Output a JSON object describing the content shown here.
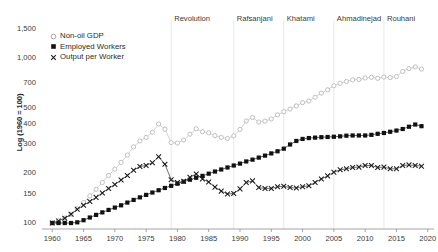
{
  "chart_data": {
    "type": "line",
    "title": "",
    "xlabel": "",
    "ylabel": "Log (1960 = 100)",
    "yscale": "log",
    "ylim": [
      92,
      1650
    ],
    "xlim": [
      1959,
      2021
    ],
    "grid": false,
    "legend_position": "top-left",
    "yticks": [
      100,
      150,
      200,
      300,
      400,
      500,
      700,
      1000,
      1500
    ],
    "ytick_labels": [
      "100",
      "150",
      "200",
      "300",
      "400",
      "500",
      "700",
      "1,000",
      "1,500"
    ],
    "xticks": [
      1960,
      1965,
      1970,
      1975,
      1980,
      1985,
      1990,
      1995,
      2000,
      2005,
      2010,
      2015,
      2020
    ],
    "xtick_labels": [
      "1960",
      "1965",
      "1970",
      "1975",
      "1980",
      "1985",
      "1990",
      "1995",
      "2000",
      "2005",
      "2010",
      "2015",
      "2020"
    ],
    "annotations": [
      {
        "label": "Revolution",
        "x": 1979
      },
      {
        "label": "Rafsanjani",
        "x": 1989
      },
      {
        "label": "Khatami",
        "x": 1997
      },
      {
        "label": "Ahmadinejad",
        "x": 2005
      },
      {
        "label": "Rouhani",
        "x": 2013
      }
    ],
    "x": [
      1960,
      1961,
      1962,
      1963,
      1964,
      1965,
      1966,
      1967,
      1968,
      1969,
      1970,
      1971,
      1972,
      1973,
      1974,
      1975,
      1976,
      1977,
      1978,
      1979,
      1980,
      1981,
      1982,
      1983,
      1984,
      1985,
      1986,
      1987,
      1988,
      1989,
      1990,
      1991,
      1992,
      1993,
      1994,
      1995,
      1996,
      1997,
      1998,
      1999,
      2000,
      2001,
      2002,
      2003,
      2004,
      2005,
      2006,
      2007,
      2008,
      2009,
      2010,
      2011,
      2012,
      2013,
      2014,
      2015,
      2016,
      2017,
      2018,
      2019
    ],
    "series": [
      {
        "name": "Non-oil GDP",
        "marker": "open-circle",
        "color": "#b9b9b9",
        "values": [
          100,
          103,
          107,
          113,
          122,
          133,
          146,
          160,
          176,
          194,
          212,
          233,
          258,
          289,
          314,
          330,
          355,
          398,
          370,
          307,
          305,
          318,
          345,
          372,
          357,
          352,
          338,
          330,
          325,
          337,
          369,
          415,
          436,
          409,
          414,
          427,
          452,
          472,
          490,
          512,
          536,
          548,
          578,
          612,
          641,
          678,
          702,
          720,
          736,
          740,
          756,
          763,
          752,
          765,
          760,
          772,
          828,
          861,
          882,
          855
        ],
        "values_note": "index, 1960 = 100"
      },
      {
        "name": "Employed Workers",
        "marker": "filled-square",
        "color": "#111111",
        "values": [
          100,
          100,
          100,
          100,
          101,
          104,
          108,
          112,
          116,
          120,
          124,
          128,
          133,
          138,
          143,
          148,
          153,
          158,
          163,
          168,
          173,
          178,
          183,
          188,
          193,
          199,
          205,
          211,
          217,
          223,
          229,
          236,
          242,
          249,
          256,
          264,
          272,
          282,
          299,
          314,
          323,
          327,
          329,
          331,
          332,
          333,
          335,
          338,
          339,
          339,
          339,
          342,
          347,
          351,
          357,
          363,
          371,
          383,
          395,
          386
        ],
        "values_note": "index, 1960 = 100"
      },
      {
        "name": "Output per Worker",
        "marker": "cross",
        "color": "#1a1a1a",
        "values": [
          100,
          103,
          107,
          113,
          121,
          128,
          135,
          143,
          152,
          162,
          171,
          182,
          194,
          209,
          220,
          223,
          232,
          252,
          227,
          183,
          176,
          179,
          189,
          198,
          185,
          177,
          165,
          156,
          150,
          151,
          161,
          176,
          180,
          164,
          162,
          162,
          166,
          167,
          164,
          163,
          166,
          168,
          176,
          185,
          193,
          203,
          210,
          213,
          217,
          218,
          223,
          223,
          217,
          218,
          213,
          213,
          223,
          225,
          223,
          221
        ],
        "values_note": "index, 1960 = 100"
      }
    ]
  },
  "legend": {
    "items": [
      {
        "label": "Non-oil GDP",
        "marker": "open-circle"
      },
      {
        "label": "Employed Workers",
        "marker": "filled-square"
      },
      {
        "label": "Output per Worker",
        "marker": "cross"
      }
    ]
  },
  "colors": {
    "background": "#ffffff",
    "axis": "#9a9a9a",
    "text": "#3a3a3a",
    "divider": "#e8e8e8",
    "gdp": "#b9b9b9",
    "workers": "#111111",
    "output": "#1a1a1a"
  }
}
